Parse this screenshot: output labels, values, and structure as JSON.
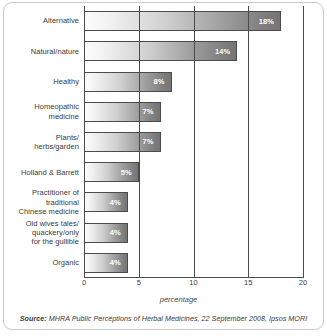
{
  "chart_data": {
    "type": "bar",
    "orientation": "horizontal",
    "title": "",
    "xlabel": "percentage",
    "ylabel": "",
    "xlim": [
      0,
      20
    ],
    "xticks": [
      0,
      5,
      10,
      15,
      20
    ],
    "grid": true,
    "legend": false,
    "categories": [
      "Alternative",
      "Natural/nature",
      "Healthy",
      "Homeopathic medicine",
      "Plants/ herbs/garden",
      "Holland & Barrett",
      "Practitioner of traditional Chinese medicine",
      "Old wives tales/ quackery/only for the gullible",
      "Organic"
    ],
    "values": [
      18,
      14,
      8,
      7,
      7,
      5,
      4,
      4,
      4
    ],
    "value_labels": [
      "18%",
      "14%",
      "8%",
      "7%",
      "7%",
      "5%",
      "4%",
      "4%",
      "4%"
    ],
    "bars": [
      {
        "label_lines": [
          "Alternative"
        ],
        "value": 18,
        "value_label": "18%"
      },
      {
        "label_lines": [
          "Natural/nature"
        ],
        "value": 14,
        "value_label": "14%"
      },
      {
        "label_lines": [
          "Healthy"
        ],
        "value": 8,
        "value_label": "8%"
      },
      {
        "label_lines": [
          "Homeopathic",
          "medicine"
        ],
        "value": 7,
        "value_label": "7%"
      },
      {
        "label_lines": [
          "Plants/",
          "herbs/garden"
        ],
        "value": 7,
        "value_label": "7%"
      },
      {
        "label_lines": [
          "Holland & Barrett"
        ],
        "value": 5,
        "value_label": "5%"
      },
      {
        "label_lines": [
          "Practitioner of",
          "traditional",
          "Chinese medicine"
        ],
        "value": 4,
        "value_label": "4%"
      },
      {
        "label_lines": [
          "Old wives tales/",
          "quackery/only",
          "for the gullible"
        ],
        "value": 4,
        "value_label": "4%"
      },
      {
        "label_lines": [
          "Organic"
        ],
        "value": 4,
        "value_label": "4%"
      }
    ]
  },
  "source": {
    "label": "Source:",
    "text": " MHRA Public Perceptions of Herbal Medicines, 22 September 2008, Ipsos MORI"
  },
  "colors": {
    "bar_gradient_start": "#fdfdfd",
    "bar_gradient_end": "#757575",
    "bar_border": "#4b4b4b",
    "axis": "#4b4b4b",
    "text": "#3a3a3a",
    "frame": "#c9c9c9",
    "value_text": "#ffffff",
    "background": "#ffffff"
  }
}
